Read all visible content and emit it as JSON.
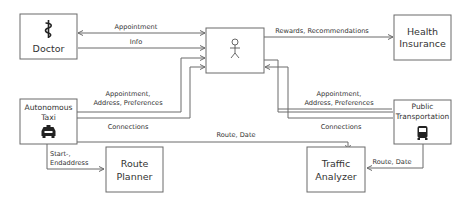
{
  "nodes": {
    "doctor": {
      "label": "Doctor",
      "icon": "caduceus-icon"
    },
    "user": {
      "icon": "stick-figure-icon"
    },
    "health_insurance": {
      "line1": "Health",
      "line2": "Insurance"
    },
    "autonomous_taxi": {
      "line1": "Autonomous",
      "line2": "Taxi",
      "icon": "taxi-icon"
    },
    "public_transportation": {
      "line1": "Public",
      "line2": "Transportation",
      "icon": "bus-icon"
    },
    "route_planner": {
      "line1": "Route",
      "line2": "Planner"
    },
    "traffic_analyzer": {
      "line1": "Traffic",
      "line2": "Analyzer"
    }
  },
  "edges": {
    "doctor_user_appointment": "Appointment",
    "doctor_user_info": "Info",
    "user_insurance": "Rewards, Recommendations",
    "taxi_user_line1": "Appointment,",
    "taxi_user_line2": "Address, Preferences",
    "taxi_connections": "Connections",
    "taxi_traffic": "Route, Date",
    "pt_user_line1": "Appointment,",
    "pt_user_line2": "Address, Preferences",
    "pt_connections": "Connections",
    "pt_traffic": "Route, Date",
    "taxi_route_line1": "Start-,",
    "taxi_route_line2": "Endaddress"
  }
}
